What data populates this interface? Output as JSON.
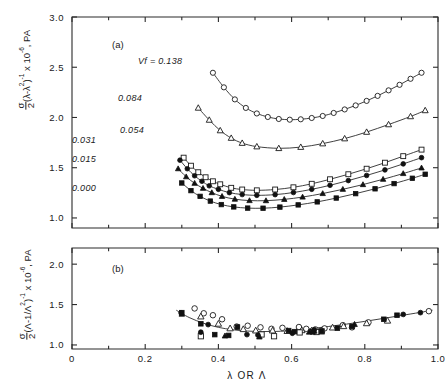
{
  "figure": {
    "xaxis": {
      "title": "λ  OR  Λ",
      "ticks": [
        "0",
        "0.2",
        "0.4",
        "0.6",
        "0.8",
        "1.0"
      ],
      "tickvals": [
        0,
        0.2,
        0.4,
        0.6,
        0.8,
        1.0
      ],
      "minor_step": 0.1,
      "range": [
        0,
        1.0
      ]
    },
    "panel_a": {
      "label": "(a)",
      "ylabel_main": "(λ-λ",
      "ylabel_sigma": "σ",
      "ylabel_two": "2",
      "ylabel_sup1": "2",
      "ylabel_close": ")",
      "ylabel_sup2": "-1",
      "ylabel_tail": " x 10",
      "ylabel_sup3": "-6",
      "ylabel_unit": ", PA",
      "ticks": [
        "1.0",
        "1.5",
        "2.0",
        "2.5",
        "3.0"
      ],
      "tickvals": [
        1.0,
        1.5,
        2.0,
        2.5,
        3.0
      ],
      "range": [
        0.9,
        3.0
      ],
      "series_label_prefix": "Vf = "
    },
    "panel_b": {
      "label": "(b)",
      "ylabel_sigma": "σ",
      "ylabel_two": "2",
      "ylabel_main": "(Λ-1/Λ",
      "ylabel_sup1": "2",
      "ylabel_close": ")",
      "ylabel_sup2": "-1",
      "ylabel_tail": " x 10",
      "ylabel_sup3": "-6",
      "ylabel_unit": ", PA",
      "ticks": [
        "1.0",
        "1.5",
        "2.0"
      ],
      "tickvals": [
        1.0,
        1.5,
        2.0
      ],
      "range": [
        0.95,
        2.2
      ]
    }
  },
  "chart_data": [
    {
      "type": "line",
      "panel": "a",
      "title": "(a)",
      "xlabel": "λ OR Λ",
      "ylabel": "σ/2 (λ-λ²)⁻¹ x 10⁻⁶, PA",
      "xlim": [
        0,
        1.0
      ],
      "ylim": [
        0.9,
        3.0
      ],
      "grid": false,
      "legend_position": "inline-annotations",
      "series": [
        {
          "name": "Vf = 0.138",
          "label": "Vf = 0.138",
          "marker": "open-circle",
          "x": [
            0.385,
            0.415,
            0.445,
            0.475,
            0.505,
            0.535,
            0.565,
            0.595,
            0.625,
            0.655,
            0.685,
            0.715,
            0.745,
            0.775,
            0.805,
            0.835,
            0.865,
            0.895,
            0.925,
            0.955
          ],
          "y": [
            2.445,
            2.3,
            2.18,
            2.095,
            2.04,
            2.005,
            1.985,
            1.978,
            1.982,
            1.995,
            2.015,
            2.045,
            2.08,
            2.12,
            2.165,
            2.215,
            2.27,
            2.325,
            2.385,
            2.445
          ]
        },
        {
          "name": "Vf = 0.084",
          "label": "0.084",
          "marker": "open-triangle",
          "x": [
            0.345,
            0.375,
            0.405,
            0.435,
            0.465,
            0.505,
            0.565,
            0.625,
            0.685,
            0.745,
            0.805,
            0.865,
            0.925,
            0.965
          ],
          "y": [
            2.095,
            1.975,
            1.87,
            1.795,
            1.745,
            1.71,
            1.693,
            1.705,
            1.74,
            1.79,
            1.855,
            1.93,
            2.01,
            2.07
          ]
        },
        {
          "name": "Vf = 0.054",
          "label": "0.054",
          "marker": "open-square",
          "x": [
            0.305,
            0.325,
            0.345,
            0.365,
            0.385,
            0.405,
            0.435,
            0.465,
            0.505,
            0.555,
            0.605,
            0.655,
            0.705,
            0.755,
            0.805,
            0.855,
            0.905,
            0.955
          ],
          "y": [
            1.6,
            1.52,
            1.455,
            1.405,
            1.365,
            1.335,
            1.3,
            1.283,
            1.275,
            1.283,
            1.305,
            1.34,
            1.385,
            1.435,
            1.49,
            1.55,
            1.615,
            1.68
          ]
        },
        {
          "name": "Vf = 0.031",
          "label": "0.031",
          "marker": "filled-circle",
          "x": [
            0.295,
            0.315,
            0.335,
            0.355,
            0.375,
            0.4,
            0.43,
            0.465,
            0.505,
            0.555,
            0.605,
            0.655,
            0.705,
            0.755,
            0.805,
            0.855,
            0.905,
            0.955
          ],
          "y": [
            1.575,
            1.49,
            1.42,
            1.365,
            1.32,
            1.285,
            1.252,
            1.233,
            1.225,
            1.232,
            1.253,
            1.285,
            1.325,
            1.372,
            1.423,
            1.478,
            1.538,
            1.6
          ]
        },
        {
          "name": "Vf = 0.015",
          "label": "0.015",
          "marker": "filled-triangle",
          "x": [
            0.29,
            0.312,
            0.335,
            0.358,
            0.382,
            0.41,
            0.445,
            0.485,
            0.53,
            0.58,
            0.63,
            0.685,
            0.74,
            0.795,
            0.85,
            0.905,
            0.955
          ],
          "y": [
            1.49,
            1.41,
            1.345,
            1.295,
            1.252,
            1.215,
            1.187,
            1.173,
            1.172,
            1.185,
            1.208,
            1.243,
            1.285,
            1.332,
            1.385,
            1.442,
            1.498
          ]
        },
        {
          "name": "Vf = 0.000",
          "label": "0.000",
          "marker": "filled-square",
          "x": [
            0.3,
            0.325,
            0.35,
            0.378,
            0.408,
            0.442,
            0.48,
            0.522,
            0.568,
            0.618,
            0.67,
            0.722,
            0.775,
            0.828,
            0.88,
            0.93,
            0.965
          ],
          "y": [
            1.348,
            1.272,
            1.215,
            1.168,
            1.133,
            1.11,
            1.098,
            1.097,
            1.108,
            1.13,
            1.16,
            1.198,
            1.242,
            1.29,
            1.342,
            1.395,
            1.435
          ]
        }
      ]
    },
    {
      "type": "scatter",
      "panel": "b",
      "title": "(b)",
      "xlabel": "λ OR Λ",
      "ylabel": "σ/2 (Λ-1/Λ²)⁻¹ x 10⁻⁶, PA",
      "xlim": [
        0,
        1.0
      ],
      "ylim": [
        0.95,
        2.2
      ],
      "grid": false,
      "legend_position": "none",
      "fit_curve": {
        "name": "master-curve",
        "x": [
          0.285,
          0.32,
          0.36,
          0.4,
          0.44,
          0.48,
          0.52,
          0.56,
          0.6,
          0.65,
          0.7,
          0.75,
          0.8,
          0.85,
          0.9,
          0.95,
          0.985
        ],
        "y": [
          1.43,
          1.34,
          1.268,
          1.218,
          1.188,
          1.172,
          1.166,
          1.168,
          1.178,
          1.2,
          1.228,
          1.258,
          1.292,
          1.328,
          1.365,
          1.402,
          1.43
        ]
      },
      "series": [
        {
          "name": "open-circle-set",
          "marker": "open-circle",
          "x": [
            0.335,
            0.36,
            0.385,
            0.41,
            0.45,
            0.48,
            0.515,
            0.545,
            0.575,
            0.62,
            0.64,
            0.665,
            0.69,
            0.74,
            0.765,
            0.81,
            0.975
          ],
          "y": [
            1.452,
            1.392,
            1.368,
            1.318,
            1.228,
            1.238,
            1.218,
            1.2,
            1.212,
            1.222,
            1.2,
            1.192,
            1.205,
            1.245,
            1.218,
            1.28,
            1.418
          ]
        },
        {
          "name": "open-triangle-set",
          "marker": "open-triangle",
          "x": [
            0.352,
            0.4,
            0.432,
            0.468,
            0.502,
            0.548,
            0.588,
            0.628,
            0.655,
            0.682,
            0.712,
            0.742,
            0.805,
            0.862
          ],
          "y": [
            1.352,
            1.262,
            1.205,
            1.195,
            1.178,
            1.178,
            1.172,
            1.182,
            1.178,
            1.178,
            1.215,
            1.232,
            1.268,
            1.3
          ]
        },
        {
          "name": "open-square-set",
          "marker": "open-square",
          "x": [
            0.352,
            0.518,
            0.552,
            0.622,
            0.668,
            0.682
          ],
          "y": [
            1.108,
            1.13,
            1.108,
            1.155,
            1.16,
            1.168
          ]
        },
        {
          "name": "filled-circle-set",
          "marker": "filled-circle",
          "x": [
            0.298,
            0.352,
            0.372,
            0.478,
            0.508,
            0.602,
            0.662,
            0.905,
            0.952
          ],
          "y": [
            1.398,
            1.158,
            1.252,
            1.128,
            1.122,
            1.145,
            1.188,
            1.378,
            1.4
          ]
        },
        {
          "name": "filled-triangle-set",
          "marker": "filled-triangle",
          "x": [
            0.3,
            0.418,
            0.512,
            0.648,
            0.662,
            0.772
          ],
          "y": [
            1.382,
            1.112,
            1.1,
            1.16,
            1.172,
            1.255
          ]
        },
        {
          "name": "filled-square-set",
          "marker": "filled-square",
          "x": [
            0.3,
            0.352,
            0.39,
            0.428,
            0.452,
            0.592,
            0.608,
            0.658,
            0.682,
            0.725,
            0.765,
            0.852,
            0.888
          ],
          "y": [
            1.4,
            1.262,
            1.128,
            1.118,
            1.222,
            1.178,
            1.165,
            1.162,
            1.17,
            1.208,
            1.228,
            1.318,
            1.368
          ]
        }
      ]
    }
  ]
}
